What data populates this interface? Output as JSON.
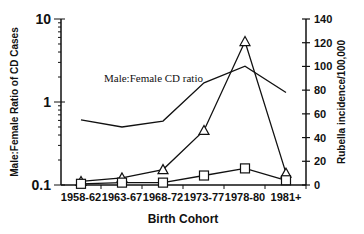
{
  "chart_data": {
    "type": "line",
    "title": "",
    "xlabel": "Birth Cohort",
    "ylabel_left": "Male:Female Ratio of CD Cases",
    "ylabel_right": "Rubella incidence/100,000",
    "categories": [
      "1958-62",
      "1963-67",
      "1968-72",
      "1973-77",
      "1978-80",
      "1981+"
    ],
    "left_axis": {
      "scale": "log",
      "ylim": [
        0.1,
        10
      ],
      "ticks": [
        "10",
        "1",
        "0.1"
      ]
    },
    "right_axis": {
      "scale": "linear",
      "ylim": [
        0,
        140
      ],
      "ticks": [
        "0",
        "20",
        "40",
        "60",
        "80",
        "100",
        "120",
        "140"
      ]
    },
    "series": [
      {
        "name": "Male:Female CD ratio",
        "axis": "left",
        "marker": "none",
        "values": [
          0.61,
          0.5,
          0.59,
          1.7,
          2.7,
          1.3
        ]
      },
      {
        "name": "Rubella incidence (triangles)",
        "axis": "right",
        "marker": "triangle",
        "values": [
          3,
          6,
          13,
          46,
          121,
          10
        ]
      },
      {
        "name": "Squares series",
        "axis": "right",
        "marker": "square",
        "values": [
          1,
          2,
          2,
          8,
          14,
          4
        ]
      }
    ],
    "annotations": [
      "Male:Female CD ratio"
    ],
    "grid": false,
    "legend": "none"
  }
}
